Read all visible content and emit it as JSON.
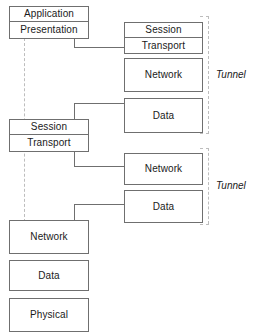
{
  "diagram": {
    "colors": {
      "box_border": "#6f6f6f",
      "box_fill": "#ffffff",
      "text": "#1a1a1a",
      "connector": "#6f6f6f",
      "dashed_guide": "#bdbdbd",
      "background": "#ffffff"
    },
    "left_column": {
      "top_stack": [
        {
          "label": "Application"
        },
        {
          "label": "Presentation"
        }
      ],
      "middle_stack": [
        {
          "label": "Session"
        },
        {
          "label": "Transport"
        }
      ],
      "bottom_stack": [
        {
          "label": "Network"
        },
        {
          "label": "Data"
        },
        {
          "label": "Physical"
        }
      ]
    },
    "right_column": {
      "tunnel_group_1": {
        "tunnel_label": "Tunnel",
        "pair": [
          {
            "label": "Session"
          },
          {
            "label": "Transport"
          }
        ],
        "single_boxes": [
          {
            "label": "Network"
          },
          {
            "label": "Data"
          }
        ]
      },
      "tunnel_group_2": {
        "tunnel_label": "Tunnel",
        "single_boxes": [
          {
            "label": "Network"
          },
          {
            "label": "Data"
          }
        ]
      }
    }
  }
}
